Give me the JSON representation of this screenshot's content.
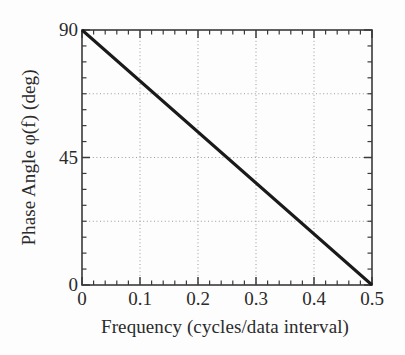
{
  "chart_data": {
    "type": "line",
    "title": "",
    "xlabel": "Frequency (cycles/data interval)",
    "ylabel": "Phase Angle φ(f) (deg)",
    "xlim": [
      0,
      0.5
    ],
    "ylim": [
      0,
      90
    ],
    "grid": true,
    "grid_style": "dotted",
    "legend": "none",
    "x_major_ticks": [
      0,
      0.1,
      0.2,
      0.3,
      0.4,
      0.5
    ],
    "x_tick_labels": [
      "0",
      "0.1",
      "0.2",
      "0.3",
      "0.4",
      "0.5"
    ],
    "x_minor_step": 0.02,
    "y_major_ticks": [
      0,
      45,
      90
    ],
    "y_tick_labels": [
      "0",
      "45",
      "90"
    ],
    "y_minor_step": 5.625,
    "x_gridlines": [
      0.1,
      0.2,
      0.3,
      0.4
    ],
    "y_gridlines": [
      22.5,
      45,
      67.5
    ],
    "series": [
      {
        "name": "phase",
        "color": "#1a1a1a",
        "line_width": 3,
        "x": [
          0.0,
          0.05,
          0.1,
          0.15,
          0.2,
          0.25,
          0.3,
          0.35,
          0.4,
          0.45,
          0.5
        ],
        "values": [
          90,
          81,
          72,
          63,
          54,
          45,
          36,
          27,
          18,
          9,
          0
        ]
      }
    ],
    "annotations": []
  },
  "style": {
    "axis_color": "#3a3a3a",
    "grid_color": "#9a9a9a",
    "text_color": "#2b2b2b",
    "background": "#fdfdfd"
  }
}
